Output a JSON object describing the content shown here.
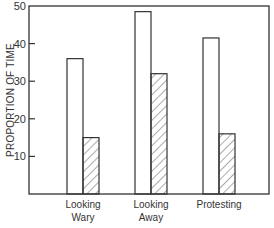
{
  "chart_data": {
    "type": "bar",
    "title": "",
    "xlabel": "",
    "ylabel": "PROPORTION OF TIME",
    "ylim": [
      0,
      50
    ],
    "yticks": [
      10,
      20,
      30,
      40,
      50
    ],
    "grid": false,
    "legend": null,
    "categories": [
      "Looking Wary",
      "Looking Away",
      "Protesting"
    ],
    "category_lines": [
      [
        "Looking",
        "Wary"
      ],
      [
        "Looking",
        "Away"
      ],
      [
        "Protesting"
      ]
    ],
    "series": [
      {
        "name": "open",
        "style": "white",
        "values": [
          36,
          48.5,
          41.5
        ]
      },
      {
        "name": "hatched",
        "style": "diagonal-hatch",
        "values": [
          15,
          32,
          16
        ]
      }
    ]
  }
}
